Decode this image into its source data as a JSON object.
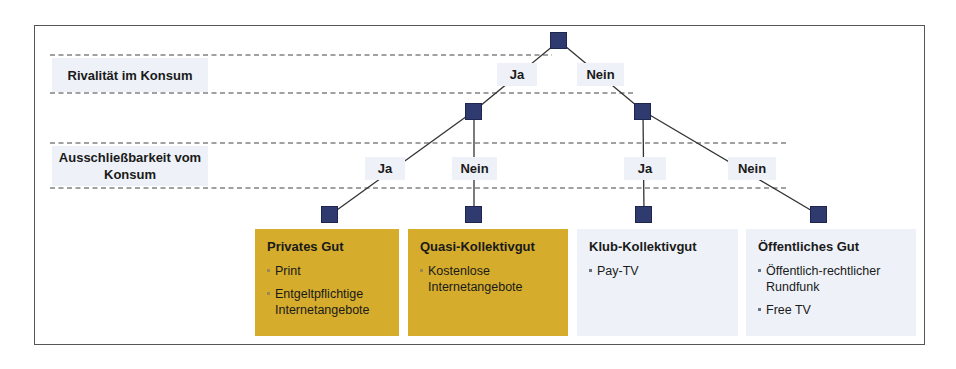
{
  "axis_labels": {
    "rivalry": "Rivalität im Konsum",
    "excludability": "Ausschließbarkeit vom Konsum"
  },
  "level1": {
    "yes": "Ja",
    "no": "Nein"
  },
  "level2": {
    "left_yes": "Ja",
    "left_no": "Nein",
    "right_yes": "Ja",
    "right_no": "Nein"
  },
  "outcomes": [
    {
      "title": "Privates Gut",
      "items": [
        "Print",
        "Entgeltpflichtige Internetangebote"
      ],
      "color": "#d5ac2c"
    },
    {
      "title": "Quasi-Kollektivgut",
      "items": [
        "Kostenlose Internetangebote"
      ],
      "color": "#d5ac2c"
    },
    {
      "title": "Klub-Kollektivgut",
      "items": [
        "Pay-TV"
      ],
      "color": "#eef2f8"
    },
    {
      "title": "Öffentliches Gut",
      "items": [
        "Öffentlich-rechtlicher Rundfunk",
        "Free TV"
      ],
      "color": "#eef2f8"
    }
  ],
  "colors": {
    "node": "#2f3a6f",
    "highlight": "#d5ac2c",
    "label_bg": "#eef2f8"
  }
}
